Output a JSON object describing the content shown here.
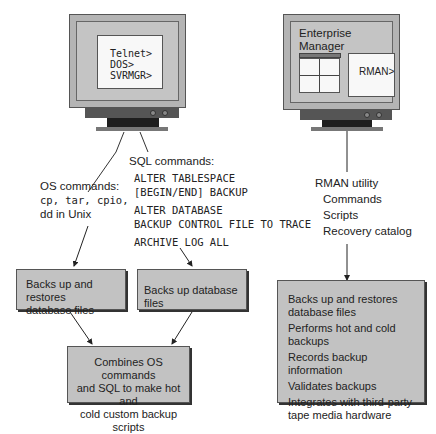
{
  "left_monitor": {
    "prompts": [
      "Telnet>",
      "DOS>",
      "SVRMGR>"
    ]
  },
  "right_monitor": {
    "title_line1": "Enterprise",
    "title_line2": "Manager",
    "prompt": "RMAN>"
  },
  "os_commands": {
    "heading": "OS commands:",
    "commands": "cp, tar, cpio,",
    "note": "dd in Unix"
  },
  "sql_commands": {
    "heading": "SQL commands:",
    "lines": [
      "ALTER TABLESPACE",
      "[BEGIN/END] BACKUP",
      "ALTER DATABASE",
      "BACKUP CONTROL FILE TO TRACE",
      "ARCHIVE LOG ALL"
    ]
  },
  "rman": {
    "heading": "RMAN utility",
    "items": [
      "Commands",
      "Scripts",
      "Recovery catalog"
    ]
  },
  "boxes": {
    "os_box": [
      "Backs up and restores",
      "database files"
    ],
    "sql_box": "Backs up database files",
    "combined_box": [
      "Combines OS commands",
      "and SQL to make hot and",
      "cold custom backup scripts"
    ],
    "rman_box": [
      "Backs up and restores",
      "database files",
      "Performs hot and cold backups",
      "Records backup information",
      "Validates backups",
      "Integrates with third-party",
      "tape media hardware"
    ]
  }
}
